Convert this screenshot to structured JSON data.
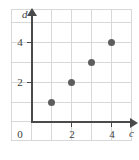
{
  "figure": {
    "kind": "coordinate-grid-scatter-plot",
    "origin_label": "0"
  },
  "axes": {
    "x": {
      "label": "c",
      "tick_labels": [
        "2",
        "4"
      ],
      "tick_values": [
        2,
        4
      ]
    },
    "y": {
      "label": "d",
      "tick_labels": [
        "2",
        "4"
      ],
      "tick_values": [
        2,
        4
      ]
    }
  },
  "colors": {
    "grid": "#d8d8d8",
    "axis": "#4a4a4a",
    "point": "#5d5d5d",
    "text": "#3d3d3d",
    "background": "#ffffff",
    "frame": "#e3e3e3"
  },
  "chart_data": {
    "type": "scatter",
    "title": "",
    "xlabel": "c",
    "ylabel": "d",
    "x": [
      1,
      2,
      3,
      4
    ],
    "y": [
      1,
      2,
      3,
      4
    ],
    "points": [
      {
        "x": 1,
        "y": 1
      },
      {
        "x": 2,
        "y": 2
      },
      {
        "x": 3,
        "y": 3
      },
      {
        "x": 4,
        "y": 4
      }
    ],
    "xlim": [
      0,
      5
    ],
    "ylim": [
      0,
      5
    ],
    "xticks": [
      2,
      4
    ],
    "yticks": [
      2,
      4
    ],
    "xtick_labels": [
      "2",
      "4"
    ],
    "ytick_labels": [
      "2",
      "4"
    ],
    "grid": true,
    "legend": null,
    "origin_label": "0",
    "annotations": []
  }
}
